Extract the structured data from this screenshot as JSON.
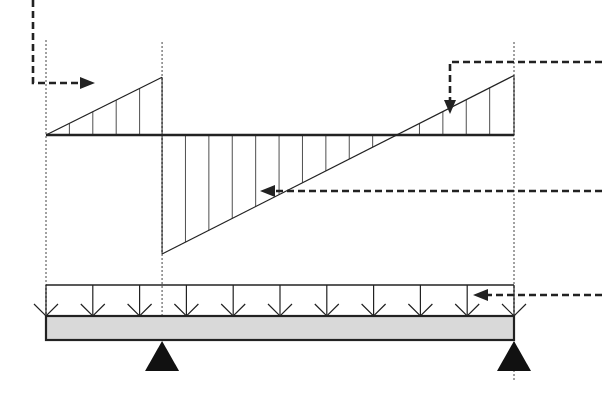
{
  "diagram": {
    "kind": "shear-force-diagram-overhanging-beam",
    "colors": {
      "ink": "#222222",
      "beam_fill": "#d9d9d9",
      "support_fill": "#111111",
      "background": "#ffffff"
    },
    "beam": {
      "description": "Beam with left overhang, pinned support at interior point and roller/pin at right end",
      "span_ratio_overhang_to_total": 0.248,
      "load": "uniformly distributed downward load along full length",
      "load_arrow_count": 11
    },
    "supports": [
      {
        "name": "left-interior-support",
        "position_fraction": 0.248
      },
      {
        "name": "right-end-support",
        "position_fraction": 1.0
      }
    ],
    "shear_diagram": {
      "segments": [
        {
          "name": "overhang-positive",
          "from": 0.0,
          "to": 0.248,
          "start_value": 0.0,
          "end_value": 0.33
        },
        {
          "name": "span-linear",
          "from": 0.248,
          "to": 1.0,
          "start_value": -0.68,
          "end_value": 0.34
        }
      ],
      "zero_crossing_fraction": 0.756
    },
    "callouts": [
      {
        "name": "callout-overhang-shear",
        "direction": "right"
      },
      {
        "name": "callout-right-reaction-shear",
        "direction": "down"
      },
      {
        "name": "callout-span-shear",
        "direction": "left"
      },
      {
        "name": "callout-distributed-load",
        "direction": "left"
      }
    ]
  }
}
